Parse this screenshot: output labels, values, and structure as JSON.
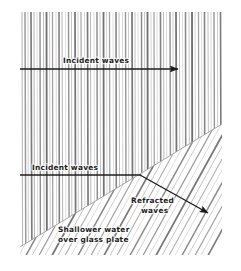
{
  "figure": {
    "medium": "hand-drawn pencil diagram",
    "background_color": "#ffffff",
    "ink_color": "#1c1c1c",
    "wave_color": "#8a8a8a"
  },
  "labels": {
    "incident_top": "Incident waves",
    "incident_lower": "Incident waves",
    "refracted_line1": "Refracted",
    "refracted_line2": "waves",
    "caption_line1": "Shallower water",
    "caption_line2": "over glass plate"
  },
  "arrows": {
    "incident_top": {
      "name": "incident-top-arrow",
      "x1": 20,
      "y1": 69,
      "x2": 178,
      "y2": 69,
      "direction": "right"
    },
    "incident_lower": {
      "name": "incident-lower-arrow",
      "x1": 20,
      "y1": 175,
      "x2": 140,
      "y2": 175,
      "direction": "right"
    },
    "refracted": {
      "name": "refracted-arrow",
      "x1": 140,
      "y1": 175,
      "x2": 208,
      "y2": 213,
      "direction": "down-right"
    }
  },
  "regions": {
    "deep_water": {
      "name": "deep-water-region",
      "description": "vertical wavefronts, wider spacing",
      "wavefront_orientation_deg": 90,
      "wavefront_count": 34
    },
    "shallow_water": {
      "name": "shallow-water-region",
      "description": "tilted wavefronts over glass plate, closer spacing",
      "wavefront_orientation_deg": 61,
      "wavefront_count": 26
    }
  },
  "boundary": {
    "name": "medium-boundary",
    "x1": 20,
    "y1": 247,
    "x2": 222,
    "y2": 124,
    "description": "edge of glass plate separating deep and shallow water"
  },
  "frame": {
    "left": 20,
    "top": 12,
    "right": 222,
    "bottom": 255
  }
}
